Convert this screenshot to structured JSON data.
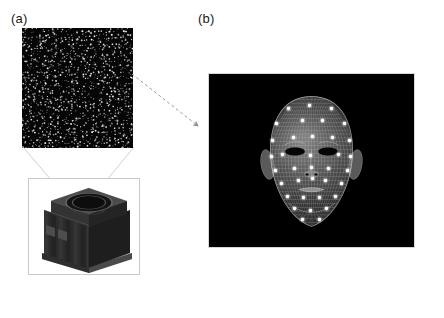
{
  "figure": {
    "background_color": "#ffffff",
    "width": 444,
    "height": 318
  },
  "panels": [
    {
      "id": "a",
      "label": "(a)",
      "description": "Infrared structured-light speckle dot pattern emitted by a projector module",
      "components": {
        "pattern": {
          "name": "ir-speckle-pattern",
          "background_color": "#060606",
          "dot_color": "#d8d8d8",
          "dot_count": 1400,
          "x": 22,
          "y": 28,
          "width": 111,
          "height": 120
        },
        "projector": {
          "name": "ir-projector-device",
          "body_color": "#2a2a2a",
          "frame_color": "#c9c9c9",
          "x": 28,
          "y": 178,
          "width": 112,
          "height": 97
        },
        "cone": {
          "name": "projection-cone",
          "line_color": "#cccccc"
        }
      }
    },
    {
      "id": "b",
      "label": "(b)",
      "description": "3D wireframe head mesh illuminated by the projected dot pattern",
      "components": {
        "face": {
          "name": "face-mesh-render",
          "background_color": "#000000",
          "mesh_color": "#b4b4b4",
          "dot_color": "#ffffff",
          "projected_dot_count": 40,
          "x": 208,
          "y": 73,
          "width": 207,
          "height": 175
        }
      }
    }
  ],
  "connector": {
    "name": "dashed-arrow",
    "style": "dashed",
    "color": "#999999",
    "from_panel": "a",
    "to_panel": "b",
    "start": [
      130,
      72
    ],
    "end": [
      200,
      128
    ]
  },
  "chart_data": {
    "type": "diagram",
    "elements": [
      {
        "label": "(a)",
        "content": "speckle pattern + projector module"
      },
      {
        "label": "(b)",
        "content": "wireframe face mesh with projected dots"
      }
    ]
  }
}
